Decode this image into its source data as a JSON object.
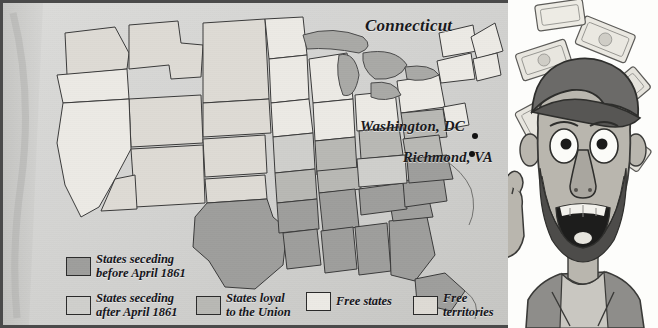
{
  "figure": {
    "kind": "historical-map-with-cartoon"
  },
  "map": {
    "panel_name": "us-secession-map",
    "background_color": "#d2d2d0",
    "border_color": "#4a4a4a",
    "labels": [
      {
        "id": "connecticut",
        "text": "Connecticut",
        "type": "state-callout"
      },
      {
        "id": "washington",
        "text": "Washington, DC",
        "type": "city"
      },
      {
        "id": "richmond",
        "text": "Richmond, VA",
        "type": "city"
      }
    ]
  },
  "legend": {
    "name": "map-legend",
    "items": [
      {
        "id": "seceding-before",
        "label": "States seceding\nbefore April 1861",
        "color": "#9e9e9c"
      },
      {
        "id": "seceding-after",
        "label": "States seceding\nafter April 1861",
        "color": "#cfcfcc"
      },
      {
        "id": "loyal-union",
        "label": "States loyal\nto the Union",
        "color": "#b8b8b4"
      },
      {
        "id": "free-states",
        "label": "Free states",
        "color": "#eceae5"
      },
      {
        "id": "free-territories",
        "label": "Free\nterritories",
        "color": "#dedbd5"
      }
    ]
  },
  "cartoon": {
    "name": "grinning-man-with-falling-money",
    "description": "Caricature of a bearded man in a cap with wide eyes and open smiling mouth, banknotes falling around him, one hand raised",
    "skin_color": "#b9b6ae",
    "hat_color": "#6b6a68",
    "beard_color": "#4d4c4a",
    "money_color": "#e8e6df"
  }
}
